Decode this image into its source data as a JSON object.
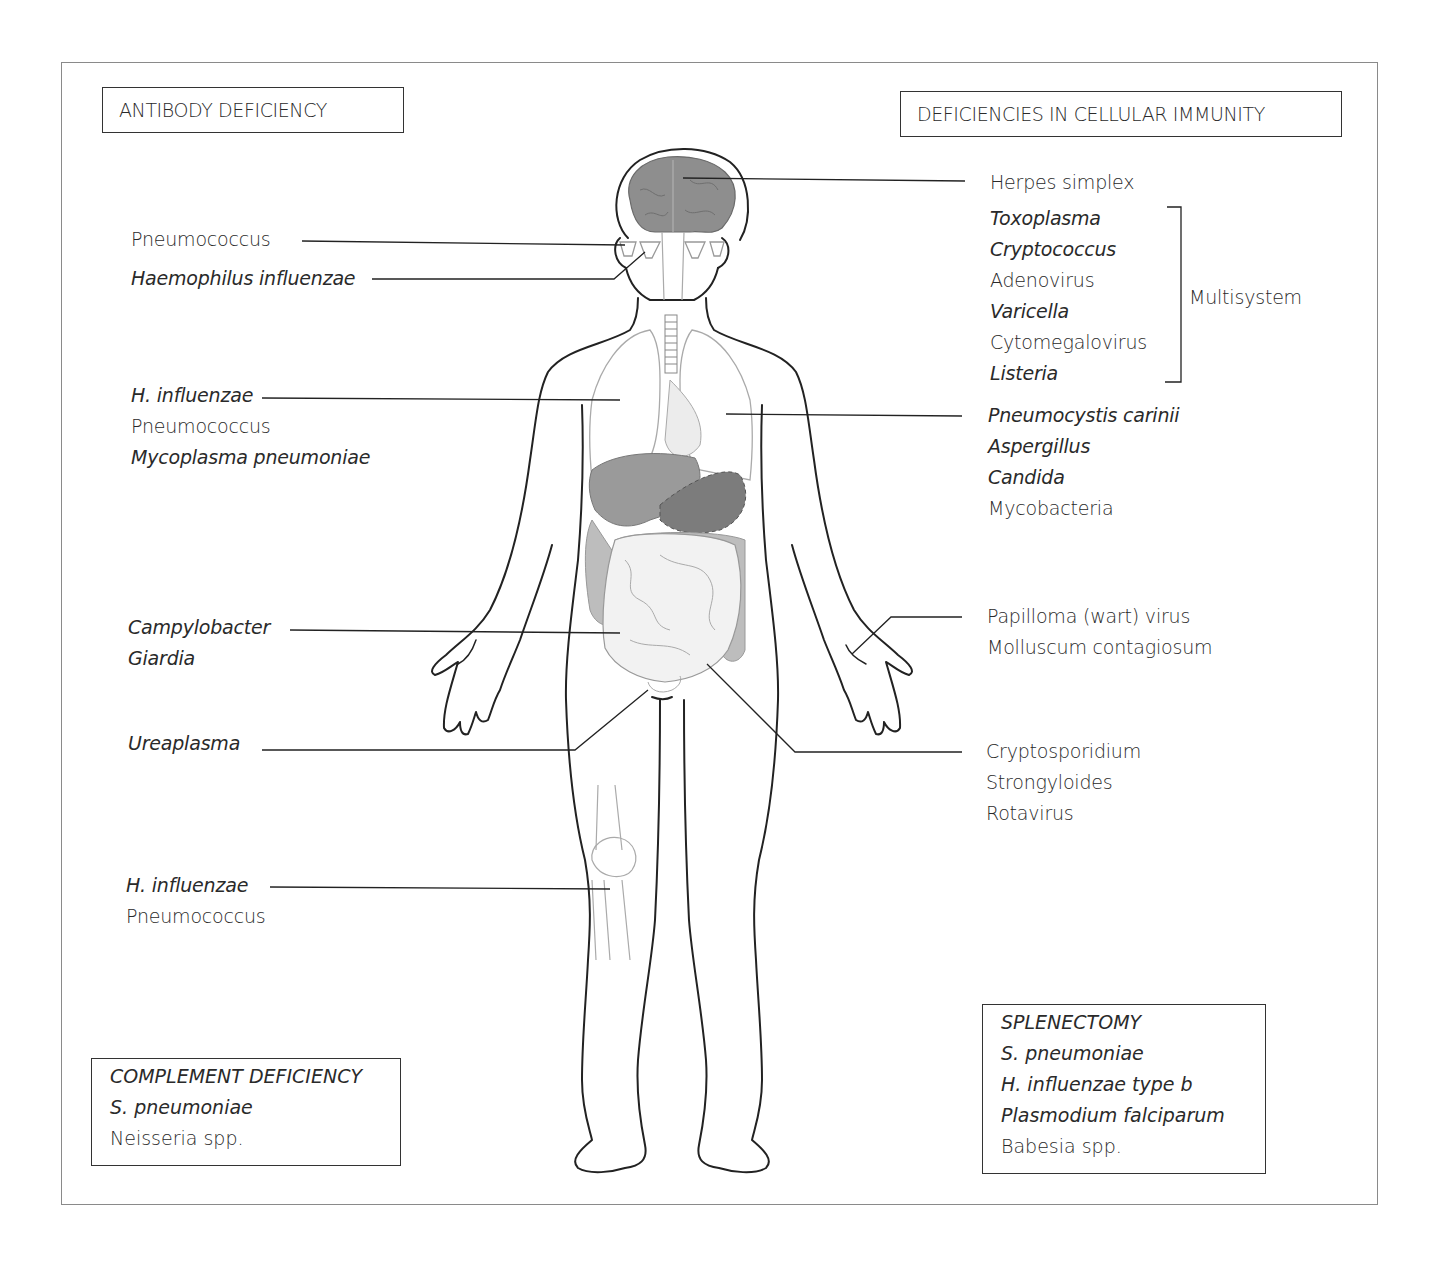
{
  "headers": {
    "antibody": "ANTIBODY DEFICIENCY",
    "cellular": "DEFICIENCIES IN CELLULAR IMMUNITY"
  },
  "left_labels": {
    "sinus": {
      "items": [
        {
          "text": "Pneumococcus",
          "italic": false
        },
        {
          "text": "Haemophilus influenzae",
          "italic": true
        }
      ]
    },
    "lungs": {
      "items": [
        {
          "text": "H. influenzae",
          "italic": true
        },
        {
          "text": "Pneumococcus",
          "italic": false
        },
        {
          "text": "Mycoplasma pneumoniae",
          "italic": true
        }
      ]
    },
    "gut": {
      "items": [
        {
          "text": "Campylobacter",
          "italic": true
        },
        {
          "text": "Giardia",
          "italic": true
        }
      ]
    },
    "urogenital": {
      "items": [
        {
          "text": "Ureaplasma",
          "italic": true
        }
      ]
    },
    "joints": {
      "items": [
        {
          "text": "H. influenzae",
          "italic": true
        },
        {
          "text": "Pneumococcus",
          "italic": false
        }
      ]
    }
  },
  "right_labels": {
    "brain": {
      "items": [
        {
          "text": "Herpes simplex",
          "italic": false
        }
      ]
    },
    "multisystem": {
      "bracket_label": "Multisystem",
      "items": [
        {
          "text": "Toxoplasma",
          "italic": true
        },
        {
          "text": "Cryptococcus",
          "italic": true
        },
        {
          "text": "Adenovirus",
          "italic": false
        },
        {
          "text": "Varicella",
          "italic": true
        },
        {
          "text": "Cytomegalovirus",
          "italic": false
        },
        {
          "text": "Listeria",
          "italic": true
        }
      ]
    },
    "lungs": {
      "items": [
        {
          "text": "Pneumocystis carinii",
          "italic": true
        },
        {
          "text": "Aspergillus",
          "italic": true
        },
        {
          "text": "Candida",
          "italic": true
        },
        {
          "text": "Mycobacteria",
          "italic": false
        }
      ]
    },
    "skin": {
      "items": [
        {
          "text": "Papilloma (wart) virus",
          "italic": false
        },
        {
          "text": "Molluscum contagiosum",
          "italic": false
        }
      ]
    },
    "gut": {
      "items": [
        {
          "text": "Cryptosporidium",
          "italic": false
        },
        {
          "text": "Strongyloides",
          "italic": false
        },
        {
          "text": "Rotavirus",
          "italic": false
        }
      ]
    }
  },
  "boxes": {
    "complement": {
      "title": "COMPLEMENT DEFICIENCY",
      "items": [
        {
          "text": "S. pneumoniae",
          "italic": true
        },
        {
          "text": "Neisseria spp.",
          "italic": false
        }
      ]
    },
    "splenectomy": {
      "title": "SPLENECTOMY",
      "items": [
        {
          "text": "S. pneumoniae",
          "italic": true
        },
        {
          "text": "H. influenzae type b",
          "italic": true
        },
        {
          "text": "Plasmodium falciparum",
          "italic": true
        },
        {
          "text": "Babesia spp.",
          "italic": false
        }
      ]
    }
  },
  "colors": {
    "ink": "#2a2a2a",
    "brain": "#8e8e8e",
    "liver": "#9a9a9a",
    "stomach": "#7c7c7c",
    "colon": "#bdbdbd",
    "small_intestine": "#f2f2f2",
    "organ_outline": "#a0a0a0"
  }
}
